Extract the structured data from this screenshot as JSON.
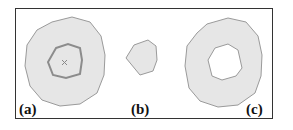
{
  "figure": {
    "panels": [
      {
        "id": "a",
        "label": "(a)",
        "description": "region with inner contour and center marker"
      },
      {
        "id": "b",
        "label": "(b)",
        "description": "small convex region"
      },
      {
        "id": "c",
        "label": "(c)",
        "description": "region with hole"
      }
    ],
    "marker_glyph": "×",
    "colors": {
      "fill": "#e6e6e6",
      "stroke": "#9a9a9a",
      "inner_stroke": "#8c8c8c",
      "border": "#333333"
    }
  }
}
